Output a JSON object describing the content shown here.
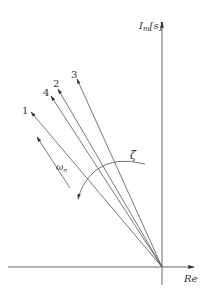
{
  "diagram": {
    "type": "s-plane pole locus",
    "axes": {
      "imag_label": "I_m[s]",
      "imag_main": "I",
      "imag_sub": "m",
      "imag_rest": "[s]",
      "real_label": "Re"
    },
    "rays": [
      {
        "id": "1",
        "label": "1"
      },
      {
        "id": "4",
        "label": "4"
      },
      {
        "id": "2",
        "label": "2"
      },
      {
        "id": "3",
        "label": "3"
      }
    ],
    "annotations": {
      "omega_main": "ω",
      "omega_sub": "n",
      "zeta": "ζ"
    },
    "colors": {
      "line": "#555555",
      "text": "#333333",
      "background": "#ffffff"
    }
  }
}
